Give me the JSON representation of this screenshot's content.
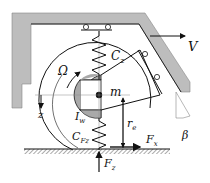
{
  "diagram": {
    "labels": {
      "velocity": "V",
      "rotation": "Ω",
      "spring_vertical": "C",
      "spring_vertical_sub": "z",
      "mass": "m",
      "inertia": "I",
      "inertia_sub": "w",
      "tire_spring": "C",
      "tire_spring_sub": "Fz",
      "z_axis": "z",
      "effective_radius": "r",
      "effective_radius_sub": "e",
      "long_force": "F",
      "long_force_sub": "x",
      "vertical_force": "F",
      "vertical_force_sub": "z",
      "angle": "β"
    },
    "colors": {
      "frame_fill": "#b8b8b8",
      "line": "#1a1a1a",
      "hub_fill": "#a9a9a9",
      "background": "#ffffff"
    }
  }
}
